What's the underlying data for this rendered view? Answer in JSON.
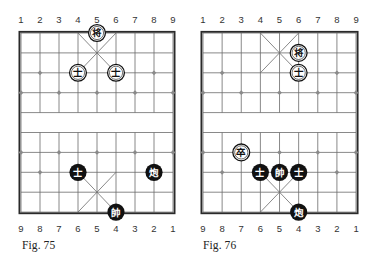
{
  "figures": [
    {
      "caption": "Fig. 75",
      "top_file_labels": [
        "1",
        "2",
        "3",
        "4",
        "5",
        "6",
        "7",
        "8",
        "9"
      ],
      "bottom_file_labels": [
        "9",
        "8",
        "7",
        "6",
        "5",
        "4",
        "3",
        "2",
        "1"
      ],
      "pieces": [
        {
          "char": "将",
          "role": "general",
          "style": "outlined",
          "file": 5,
          "rank": 1
        },
        {
          "char": "士",
          "role": "advisor",
          "style": "outlined",
          "file": 4,
          "rank": 3
        },
        {
          "char": "士",
          "role": "advisor",
          "style": "outlined",
          "file": 6,
          "rank": 3
        },
        {
          "char": "士",
          "role": "advisor",
          "style": "filled",
          "file": 4,
          "rank": 8
        },
        {
          "char": "炮",
          "role": "cannon",
          "style": "filled",
          "file": 8,
          "rank": 8
        },
        {
          "char": "帥",
          "role": "general",
          "style": "filled",
          "file": 6,
          "rank": 10
        }
      ]
    },
    {
      "caption": "Fig. 76",
      "top_file_labels": [
        "1",
        "2",
        "3",
        "4",
        "5",
        "6",
        "7",
        "8",
        "9"
      ],
      "bottom_file_labels": [
        "9",
        "8",
        "7",
        "6",
        "5",
        "4",
        "3",
        "2",
        "1"
      ],
      "pieces": [
        {
          "char": "将",
          "role": "general",
          "style": "outlined",
          "file": 6,
          "rank": 2
        },
        {
          "char": "士",
          "role": "advisor",
          "style": "outlined",
          "file": 6,
          "rank": 3
        },
        {
          "char": "卒",
          "role": "soldier",
          "style": "outlined",
          "file": 3,
          "rank": 7
        },
        {
          "char": "士",
          "role": "advisor",
          "style": "filled",
          "file": 4,
          "rank": 8
        },
        {
          "char": "帥",
          "role": "general",
          "style": "filled",
          "file": 5,
          "rank": 8
        },
        {
          "char": "士",
          "role": "advisor",
          "style": "filled",
          "file": 6,
          "rank": 8
        },
        {
          "char": "炮",
          "role": "cannon",
          "style": "filled",
          "file": 6,
          "rank": 10
        }
      ]
    }
  ],
  "markers": [
    [
      2,
      3
    ],
    [
      8,
      3
    ],
    [
      1,
      4
    ],
    [
      3,
      4
    ],
    [
      5,
      4
    ],
    [
      7,
      4
    ],
    [
      9,
      4
    ],
    [
      1,
      7
    ],
    [
      3,
      7
    ],
    [
      5,
      7
    ],
    [
      7,
      7
    ],
    [
      9,
      7
    ],
    [
      2,
      8
    ],
    [
      8,
      8
    ]
  ],
  "colors": {
    "grid": "#6b6b6b",
    "border": "#2a2a2a",
    "marker": "#8a8a8a",
    "piece_dark": "#111111",
    "piece_light": "#ffffff"
  }
}
